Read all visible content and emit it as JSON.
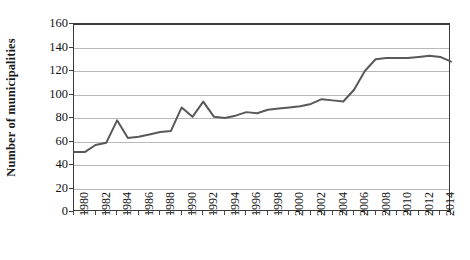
{
  "chart_data": {
    "type": "line",
    "title": "",
    "xlabel": "",
    "ylabel": "Number of municipalities",
    "ylim": [
      0,
      160
    ],
    "ytick_values": [
      0,
      20,
      40,
      60,
      80,
      100,
      120,
      140,
      160
    ],
    "ytick_labels": [
      "0",
      "20",
      "40",
      "60",
      "80",
      "100",
      "120",
      "140",
      "160"
    ],
    "xlim": [
      1980,
      2015
    ],
    "xtick_labels": [
      "1980",
      "1982",
      "1984",
      "1986",
      "1988",
      "1990",
      "1992",
      "1994",
      "1996",
      "1998",
      "2000",
      "2002",
      "2004",
      "2006",
      "2008",
      "2010",
      "2012",
      "2014"
    ],
    "xtick_values": [
      1980,
      1982,
      1984,
      1986,
      1988,
      1990,
      1992,
      1994,
      1996,
      1998,
      2000,
      2002,
      2004,
      2006,
      2008,
      2010,
      2012,
      2014
    ],
    "x": [
      1980,
      1981,
      1982,
      1983,
      1984,
      1985,
      1986,
      1987,
      1988,
      1989,
      1990,
      1991,
      1992,
      1993,
      1994,
      1995,
      1996,
      1997,
      1998,
      1999,
      2000,
      2001,
      2002,
      2003,
      2004,
      2005,
      2006,
      2007,
      2008,
      2009,
      2010,
      2011,
      2012,
      2013,
      2014,
      2015
    ],
    "values": [
      51,
      51,
      57,
      59,
      78,
      63,
      64,
      66,
      68,
      69,
      89,
      81,
      94,
      81,
      80,
      82,
      85,
      84,
      87,
      88,
      89,
      90,
      92,
      96,
      95,
      94,
      104,
      120,
      130,
      131,
      131,
      131,
      132,
      133,
      132,
      128
    ],
    "series": [
      {
        "name": "Number of municipalities",
        "color": "#595959",
        "line_width": 2,
        "markers": false,
        "values": [
          51,
          51,
          57,
          59,
          78,
          63,
          64,
          66,
          68,
          69,
          89,
          81,
          94,
          81,
          80,
          82,
          85,
          84,
          87,
          88,
          89,
          90,
          92,
          96,
          95,
          94,
          104,
          120,
          130,
          131,
          131,
          131,
          132,
          133,
          132,
          128
        ]
      }
    ],
    "grid": true,
    "grid_axis": "y",
    "grid_color": "#b9b9b9",
    "legend": false,
    "legend_position": "none",
    "background_color": "#ffffff",
    "axis_color": "#3a3a3a"
  }
}
